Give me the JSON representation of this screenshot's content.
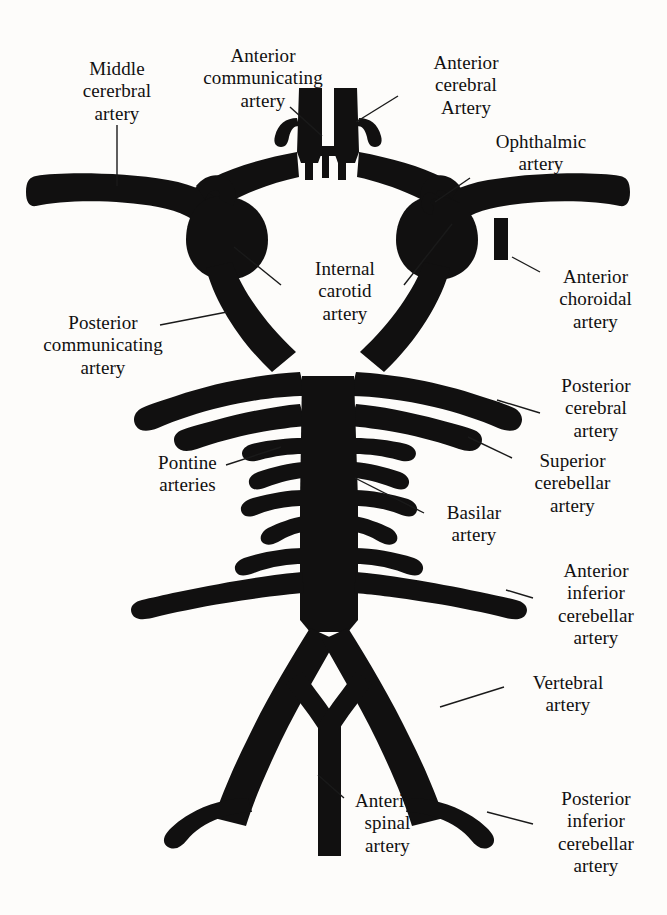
{
  "figure": {
    "background_color": "#fdfcfa",
    "vessel_color": "#111010",
    "leader_line_color": "#1a1a1a",
    "text_color": "#111010"
  },
  "labels": [
    {
      "id": "middle-cerebral-artery",
      "text": "Middle\ncererbral\nartery",
      "x": 42,
      "y": 58,
      "width": 150,
      "leader": {
        "x1": 117,
        "y1": 125,
        "x2": 117,
        "y2": 186
      }
    },
    {
      "id": "anterior-communicating-artery",
      "text": "Anterior\ncommunicating\nartery",
      "x": 168,
      "y": 45,
      "width": 190,
      "leader": {
        "x1": 290,
        "y1": 107,
        "x2": 322,
        "y2": 136
      }
    },
    {
      "id": "anterior-cerebral-artery",
      "text": "Anterior\ncerebral\nArtery",
      "x": 396,
      "y": 52,
      "width": 140,
      "leader": {
        "x1": 398,
        "y1": 96,
        "x2": 356,
        "y2": 122
      }
    },
    {
      "id": "ophthalmic-artery",
      "text": "Ophthalmic\nartery",
      "x": 466,
      "y": 131,
      "width": 150,
      "leader": {
        "x1": 470,
        "y1": 178,
        "x2": 435,
        "y2": 202
      }
    },
    {
      "id": "internal-carotid-artery",
      "text": "Internal\ncarotid\nartery",
      "x": 285,
      "y": 258,
      "width": 120,
      "leader_left": {
        "x1": 281,
        "y1": 285,
        "x2": 234,
        "y2": 247
      },
      "leader_right": {
        "x1": 404,
        "y1": 285,
        "x2": 452,
        "y2": 224
      }
    },
    {
      "id": "anterior-choroidal-artery",
      "text": "Anterior\nchoroidal\nartery",
      "x": 533,
      "y": 266,
      "width": 125,
      "leader": {
        "x1": 540,
        "y1": 272,
        "x2": 512,
        "y2": 257
      }
    },
    {
      "id": "posterior-communicating-artery",
      "text": "Posterior\ncommunicating\nartery",
      "x": 12,
      "y": 312,
      "width": 182,
      "leader": {
        "x1": 160,
        "y1": 325,
        "x2": 227,
        "y2": 312
      }
    },
    {
      "id": "posterior-cerebral-artery",
      "text": "Posterior\ncerebral\nartery",
      "x": 531,
      "y": 375,
      "width": 130,
      "leader": {
        "x1": 540,
        "y1": 413,
        "x2": 497,
        "y2": 400
      }
    },
    {
      "id": "superior-cerebellar-artery",
      "text": "Superior\ncerebellar\nartery",
      "x": 505,
      "y": 450,
      "width": 135,
      "leader": {
        "x1": 512,
        "y1": 458,
        "x2": 468,
        "y2": 437
      }
    },
    {
      "id": "pontine-arteries",
      "text": "Pontine\narteries",
      "x": 130,
      "y": 452,
      "width": 115,
      "leader": {
        "x1": 226,
        "y1": 465,
        "x2": 281,
        "y2": 447
      }
    },
    {
      "id": "basilar-artery",
      "text": "Basilar\nartery",
      "x": 424,
      "y": 502,
      "width": 100,
      "leader": {
        "x1": 424,
        "y1": 513,
        "x2": 355,
        "y2": 478
      }
    },
    {
      "id": "anterior-inferior-cerebellar-artery",
      "text": "Anterior\ninferior\ncerebellar\nartery",
      "x": 531,
      "y": 560,
      "width": 130,
      "leader": {
        "x1": 533,
        "y1": 598,
        "x2": 506,
        "y2": 590
      }
    },
    {
      "id": "vertebral-artery",
      "text": "Vertebral\nartery",
      "x": 508,
      "y": 672,
      "width": 120,
      "leader": {
        "x1": 504,
        "y1": 687,
        "x2": 440,
        "y2": 707
      }
    },
    {
      "id": "anterior-spinal-artery",
      "text": "Anterior\nspinal\nartery",
      "x": 330,
      "y": 790,
      "width": 115,
      "leader": {
        "x1": 344,
        "y1": 798,
        "x2": 318,
        "y2": 775
      }
    },
    {
      "id": "posterior-inferior-cerebellar-artery",
      "text": "Posterior\ninferior\ncerebellar\nartery",
      "x": 531,
      "y": 788,
      "width": 130,
      "leader": {
        "x1": 533,
        "y1": 824,
        "x2": 487,
        "y2": 812
      }
    }
  ],
  "vessels": {
    "anterior_cerebral_left": "ACA left ascending trunk",
    "anterior_cerebral_right": "ACA right ascending trunk",
    "anterior_communicating": "short horizontal bridge between ACA trunks",
    "middle_cerebral_left": "MCA left horizontal limb",
    "middle_cerebral_right": "MCA right horizontal limb",
    "internal_carotid_left": "ICA left siphon bulb",
    "internal_carotid_right": "ICA right siphon bulb",
    "ophthalmic": "small hook off right ICA",
    "anterior_choroidal": "small downward stub off right MCA",
    "posterior_communicating_left": "PComm left descending limb",
    "posterior_communicating_right": "PComm right descending limb",
    "posterior_cerebral_left": "PCA left lateral branch",
    "posterior_cerebral_right": "PCA right lateral branch",
    "superior_cerebellar_left": "SCA left branch",
    "superior_cerebellar_right": "SCA right branch",
    "basilar": "central vertical trunk",
    "pontine_arteries": "small paired lateral twigs off basilar",
    "aica_left": "AICA left long lateral branch",
    "aica_right": "AICA right long lateral branch",
    "vertebral_left": "left vertebral limb of V",
    "vertebral_right": "right vertebral limb of V",
    "anterior_spinal": "midline descending trunk from Y junction",
    "pica_left": "PICA left hook",
    "pica_right": "PICA right hook"
  }
}
